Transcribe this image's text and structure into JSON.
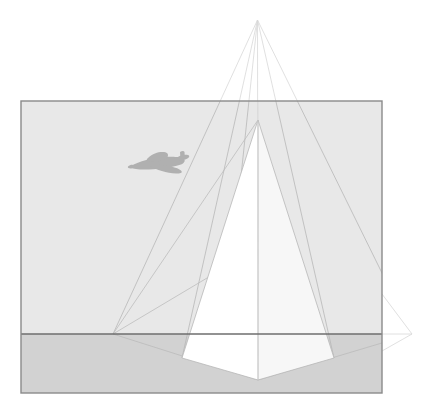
{
  "figure": {
    "canvas": {
      "width": 427,
      "height": 409
    },
    "background_color": "#ffffff"
  },
  "colors": {
    "sky": "#e8e8e8",
    "ground": "#d2d2d2",
    "monument_light": "#ffffff",
    "monument_shadow": "#f7f7f7",
    "frame_border": "#8a8a8a",
    "horizon_line": "#6e6e6e",
    "construction_line": "#b8b8b8",
    "construction_line_faint": "#d8d8d8",
    "airplane": "#b0b0b0"
  },
  "picture_frame": {
    "label": "picture plane rectangle",
    "x": 21,
    "y": 101,
    "width": 361,
    "height": 292,
    "stroke_width": 1.4
  },
  "horizon": {
    "label": "horizon line",
    "y": 334,
    "x_start": 21,
    "x_end": 382,
    "stroke_width": 1.6
  },
  "vanishing_points": [
    {
      "name": "left-vanishing-point",
      "x": 113,
      "y": 334
    },
    {
      "name": "right-vanishing-point",
      "x": 412,
      "y": 334
    }
  ],
  "apex": {
    "name": "upper-apex-point",
    "x": 257.5,
    "y": 20
  },
  "monument": {
    "label": "obelisk monument",
    "apex": {
      "x": 258,
      "y": 120
    },
    "base_front": {
      "x": 258,
      "y": 380
    },
    "base_left": {
      "x": 182,
      "y": 358
    },
    "base_right": {
      "x": 334,
      "y": 358
    },
    "left_face_points": "258,120 182,358 258,380",
    "right_face_points": "258,120 334,358 258,380",
    "sliver_points": "242,153 195,349 213,353"
  },
  "construction_lines": [
    {
      "name": "apex-to-left-vp",
      "x1": 257.5,
      "y1": 20,
      "x2": 113,
      "y2": 334
    },
    {
      "name": "apex-to-right-vp",
      "x1": 257.5,
      "y1": 20,
      "x2": 412,
      "y2": 334
    },
    {
      "name": "apex-to-base-left",
      "x1": 257.5,
      "y1": 20,
      "x2": 182,
      "y2": 358
    },
    {
      "name": "apex-to-base-right",
      "x1": 257.5,
      "y1": 20,
      "x2": 334,
      "y2": 358
    },
    {
      "name": "apex-vertical-axis",
      "x1": 257.5,
      "y1": 20,
      "x2": 258,
      "y2": 380
    },
    {
      "name": "apex-to-lower-left",
      "x1": 257.5,
      "y1": 20,
      "x2": 222,
      "y2": 356
    },
    {
      "name": "left-vp-to-right-edge",
      "x1": 113,
      "y1": 334,
      "x2": 412,
      "y2": 334
    },
    {
      "name": "left-vp-to-base-front",
      "x1": 113,
      "y1": 334,
      "x2": 258,
      "y2": 380
    },
    {
      "name": "right-vp-to-base-front",
      "x1": 412,
      "y1": 334,
      "x2": 258,
      "y2": 380
    },
    {
      "name": "left-vp-to-monument-apex",
      "x1": 113,
      "y1": 334,
      "x2": 258,
      "y2": 120
    },
    {
      "name": "left-vp-to-sliver-top",
      "x1": 113,
      "y1": 334,
      "x2": 247,
      "y2": 255
    }
  ],
  "airplane": {
    "label": "aircraft silhouette",
    "center_x": 159,
    "center_y": 164,
    "wingspan": 58,
    "heading": "left"
  },
  "legend": {
    "sky_label": "sky",
    "ground_label": "ground plane",
    "monument_label": "monument",
    "horizon_label": "horizon line",
    "vanishing_left_label": "left vanishing point",
    "vanishing_right_label": "right vanishing point",
    "apex_label": "construction apex",
    "airplane_label": "aircraft"
  }
}
